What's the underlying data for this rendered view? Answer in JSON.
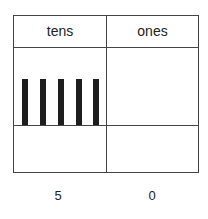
{
  "place_value_chart": {
    "headers": {
      "tens": "tens",
      "ones": "ones"
    },
    "tens_bars": 5,
    "ones_units": 0,
    "values": {
      "tens": "5",
      "ones": "0"
    }
  }
}
